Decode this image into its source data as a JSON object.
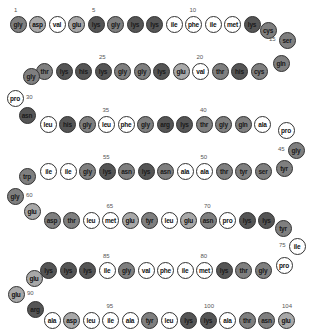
{
  "shade_colors": {
    "w": "#ffffff",
    "l": "#a8a8a8",
    "m": "#7f7f7f",
    "d": "#555555"
  },
  "residues": [
    {
      "n": 1,
      "aa": "gly",
      "s": "m"
    },
    {
      "n": 2,
      "aa": "asp",
      "s": "l"
    },
    {
      "n": 3,
      "aa": "val",
      "s": "w"
    },
    {
      "n": 4,
      "aa": "glu",
      "s": "l"
    },
    {
      "n": 5,
      "aa": "lys",
      "s": "d"
    },
    {
      "n": 6,
      "aa": "gly",
      "s": "m"
    },
    {
      "n": 7,
      "aa": "lys",
      "s": "d"
    },
    {
      "n": 8,
      "aa": "lys",
      "s": "d"
    },
    {
      "n": 9,
      "aa": "ile",
      "s": "w"
    },
    {
      "n": 10,
      "aa": "phe",
      "s": "w"
    },
    {
      "n": 11,
      "aa": "ile",
      "s": "w"
    },
    {
      "n": 12,
      "aa": "met",
      "s": "w"
    },
    {
      "n": 13,
      "aa": "lys",
      "s": "d"
    },
    {
      "n": 14,
      "aa": "cys",
      "s": "m"
    },
    {
      "n": 15,
      "aa": "ser",
      "s": "m"
    },
    {
      "n": 16,
      "aa": "gln",
      "s": "m"
    },
    {
      "n": 17,
      "aa": "cys",
      "s": "m"
    },
    {
      "n": 18,
      "aa": "his",
      "s": "d"
    },
    {
      "n": 19,
      "aa": "thr",
      "s": "m"
    },
    {
      "n": 20,
      "aa": "val",
      "s": "w"
    },
    {
      "n": 21,
      "aa": "glu",
      "s": "l"
    },
    {
      "n": 22,
      "aa": "lys",
      "s": "d"
    },
    {
      "n": 23,
      "aa": "gly",
      "s": "m"
    },
    {
      "n": 24,
      "aa": "gly",
      "s": "m"
    },
    {
      "n": 25,
      "aa": "lys",
      "s": "d"
    },
    {
      "n": 26,
      "aa": "his",
      "s": "d"
    },
    {
      "n": 27,
      "aa": "lys",
      "s": "d"
    },
    {
      "n": 28,
      "aa": "thr",
      "s": "m"
    },
    {
      "n": 29,
      "aa": "gly",
      "s": "m"
    },
    {
      "n": 30,
      "aa": "pro",
      "s": "w"
    },
    {
      "n": 31,
      "aa": "asn",
      "s": "d"
    },
    {
      "n": 32,
      "aa": "leu",
      "s": "w"
    },
    {
      "n": 33,
      "aa": "his",
      "s": "d"
    },
    {
      "n": 34,
      "aa": "gly",
      "s": "m"
    },
    {
      "n": 35,
      "aa": "leu",
      "s": "w"
    },
    {
      "n": 36,
      "aa": "phe",
      "s": "w"
    },
    {
      "n": 37,
      "aa": "gly",
      "s": "m"
    },
    {
      "n": 38,
      "aa": "arg",
      "s": "d"
    },
    {
      "n": 39,
      "aa": "lys",
      "s": "d"
    },
    {
      "n": 40,
      "aa": "thr",
      "s": "m"
    },
    {
      "n": 41,
      "aa": "gly",
      "s": "m"
    },
    {
      "n": 42,
      "aa": "gln",
      "s": "m"
    },
    {
      "n": 43,
      "aa": "ala",
      "s": "w"
    },
    {
      "n": 44,
      "aa": "pro",
      "s": "w"
    },
    {
      "n": 45,
      "aa": "gly",
      "s": "m"
    },
    {
      "n": 46,
      "aa": "tyr",
      "s": "m"
    },
    {
      "n": 47,
      "aa": "ser",
      "s": "m"
    },
    {
      "n": 48,
      "aa": "tyr",
      "s": "m"
    },
    {
      "n": 49,
      "aa": "thr",
      "s": "m"
    },
    {
      "n": 50,
      "aa": "ala",
      "s": "w"
    },
    {
      "n": 51,
      "aa": "ala",
      "s": "w"
    },
    {
      "n": 52,
      "aa": "asn",
      "s": "m"
    },
    {
      "n": 53,
      "aa": "lys",
      "s": "d"
    },
    {
      "n": 54,
      "aa": "asn",
      "s": "m"
    },
    {
      "n": 55,
      "aa": "lys",
      "s": "d"
    },
    {
      "n": 56,
      "aa": "gly",
      "s": "m"
    },
    {
      "n": 57,
      "aa": "ile",
      "s": "w"
    },
    {
      "n": 58,
      "aa": "ile",
      "s": "w"
    },
    {
      "n": 59,
      "aa": "trp",
      "s": "m"
    },
    {
      "n": 60,
      "aa": "gly",
      "s": "m"
    },
    {
      "n": 61,
      "aa": "glu",
      "s": "l"
    },
    {
      "n": 62,
      "aa": "asp",
      "s": "m"
    },
    {
      "n": 63,
      "aa": "thr",
      "s": "m"
    },
    {
      "n": 64,
      "aa": "leu",
      "s": "w"
    },
    {
      "n": 65,
      "aa": "met",
      "s": "w"
    },
    {
      "n": 66,
      "aa": "glu",
      "s": "l"
    },
    {
      "n": 67,
      "aa": "tyr",
      "s": "m"
    },
    {
      "n": 68,
      "aa": "leu",
      "s": "w"
    },
    {
      "n": 69,
      "aa": "glu",
      "s": "l"
    },
    {
      "n": 70,
      "aa": "asn",
      "s": "m"
    },
    {
      "n": 71,
      "aa": "pro",
      "s": "w"
    },
    {
      "n": 72,
      "aa": "lys",
      "s": "d"
    },
    {
      "n": 73,
      "aa": "lys",
      "s": "d"
    },
    {
      "n": 74,
      "aa": "tyr",
      "s": "m"
    },
    {
      "n": 75,
      "aa": "ile",
      "s": "w"
    },
    {
      "n": 76,
      "aa": "pro",
      "s": "w"
    },
    {
      "n": 77,
      "aa": "gly",
      "s": "m"
    },
    {
      "n": 78,
      "aa": "thr",
      "s": "m"
    },
    {
      "n": 79,
      "aa": "lys",
      "s": "d"
    },
    {
      "n": 80,
      "aa": "met",
      "s": "w"
    },
    {
      "n": 81,
      "aa": "ile",
      "s": "w"
    },
    {
      "n": 82,
      "aa": "phe",
      "s": "w"
    },
    {
      "n": 83,
      "aa": "val",
      "s": "w"
    },
    {
      "n": 84,
      "aa": "gly",
      "s": "m"
    },
    {
      "n": 85,
      "aa": "ile",
      "s": "w"
    },
    {
      "n": 86,
      "aa": "lys",
      "s": "d"
    },
    {
      "n": 87,
      "aa": "lys",
      "s": "d"
    },
    {
      "n": 88,
      "aa": "lys",
      "s": "d"
    },
    {
      "n": 89,
      "aa": "glu",
      "s": "l"
    },
    {
      "n": 90,
      "aa": "glu",
      "s": "l"
    },
    {
      "n": 91,
      "aa": "arg",
      "s": "d"
    },
    {
      "n": 92,
      "aa": "ala",
      "s": "w"
    },
    {
      "n": 93,
      "aa": "asp",
      "s": "l"
    },
    {
      "n": 94,
      "aa": "leu",
      "s": "w"
    },
    {
      "n": 95,
      "aa": "ile",
      "s": "w"
    },
    {
      "n": 96,
      "aa": "ala",
      "s": "w"
    },
    {
      "n": 97,
      "aa": "tyr",
      "s": "m"
    },
    {
      "n": 98,
      "aa": "leu",
      "s": "w"
    },
    {
      "n": 99,
      "aa": "lys",
      "s": "d"
    },
    {
      "n": 100,
      "aa": "lys",
      "s": "d"
    },
    {
      "n": 101,
      "aa": "ala",
      "s": "w"
    },
    {
      "n": 102,
      "aa": "thr",
      "s": "m"
    },
    {
      "n": 103,
      "aa": "asn",
      "s": "m"
    },
    {
      "n": 104,
      "aa": "glu",
      "s": "l"
    }
  ],
  "position_labels": [
    "1",
    "5",
    "10",
    "15",
    "20",
    "25",
    "30",
    "35",
    "40",
    "45",
    "50",
    "55",
    "60",
    "65",
    "70",
    "75",
    "80",
    "85",
    "90",
    "95",
    "100",
    "104"
  ]
}
